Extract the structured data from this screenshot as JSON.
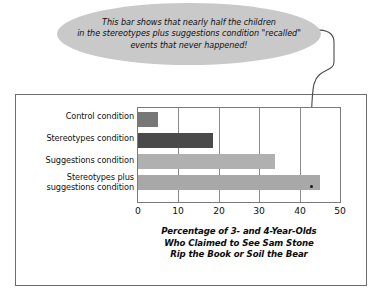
{
  "callout": {
    "text": "This bar shows that nearly half the children\nin the stereotypes plus suggestions condition \"recalled\"\nevents that never happened!",
    "fill": "#c9c9c9"
  },
  "chart_data": {
    "type": "bar",
    "orientation": "horizontal",
    "title": "",
    "xlabel": "Percentage of 3- and 4-Year-Olds\nWho Claimed to See Sam Stone\nRip the Book or Soil the Bear",
    "ylabel": "",
    "categories": [
      "Control condition",
      "Stereotypes condition",
      "Suggestions condition",
      "Stereotypes plus\nsuggestions condition"
    ],
    "values": [
      5,
      18.5,
      34,
      45
    ],
    "bar_colors": [
      "#777777",
      "#4a4a4a",
      "#b0b0b0",
      "#a8a8a8"
    ],
    "xlim": [
      0,
      50
    ],
    "xticks": [
      0,
      10,
      20,
      30,
      40,
      50
    ],
    "xtick_labels": [
      "0",
      "10",
      "20",
      "30",
      "40",
      "50"
    ],
    "grid": true,
    "legend": "none",
    "annotation_target_category": "Stereotypes plus\nsuggestions condition"
  }
}
